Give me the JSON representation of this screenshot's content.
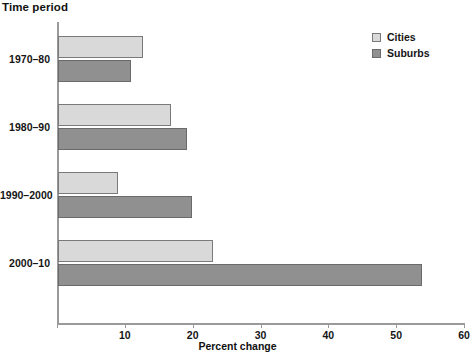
{
  "chart_data": {
    "type": "bar",
    "orientation": "horizontal",
    "title": "",
    "xlabel": "Percent change",
    "ylabel": "Time period",
    "categories": [
      "1970–80",
      "1980–90",
      "1990–2000",
      "2000–10"
    ],
    "series": [
      {
        "name": "Cities",
        "color": "#d9d9d9",
        "values": [
          12.6,
          16.7,
          8.8,
          22.9
        ]
      },
      {
        "name": "Suburbs",
        "color": "#909090",
        "values": [
          10.8,
          19.0,
          19.7,
          53.7
        ]
      }
    ],
    "xlim": [
      0,
      60
    ],
    "xticks": [
      0,
      10,
      20,
      30,
      40,
      50,
      60
    ],
    "xtick_labels": [
      "",
      "10",
      "20",
      "30",
      "40",
      "50",
      "60"
    ],
    "grid": false,
    "legend_position": "top-right"
  },
  "legend": {
    "entries": [
      {
        "label": "Cities"
      },
      {
        "label": "Suburbs"
      }
    ]
  }
}
